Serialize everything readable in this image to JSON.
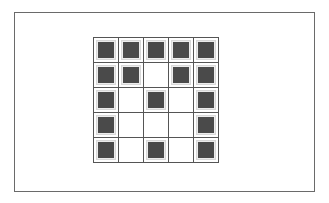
{
  "diagram": {
    "type": "binary-pixel-grid",
    "rows": 5,
    "cols": 5,
    "pattern": [
      [
        1,
        1,
        1,
        1,
        1
      ],
      [
        1,
        1,
        0,
        1,
        1
      ],
      [
        1,
        0,
        1,
        0,
        1
      ],
      [
        1,
        0,
        0,
        0,
        1
      ],
      [
        1,
        0,
        1,
        0,
        1
      ]
    ],
    "colors": {
      "filled": "#4a4a4a",
      "empty": "#ffffff",
      "gridline": "#555555",
      "frame": "#6a6a6a"
    }
  }
}
